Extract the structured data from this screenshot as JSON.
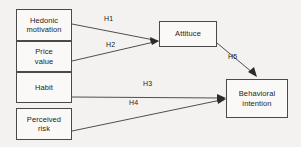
{
  "diagram": {
    "type": "path-diagram",
    "background_color": "#f3f2f0",
    "box_fill_color": "#faf9f7",
    "box_border_color": "#4a4a48",
    "line_color": "#3c3c3a",
    "nodes": [
      {
        "id": "hedonic",
        "line1": "Hedonic",
        "line2": "motivation"
      },
      {
        "id": "price",
        "line1": "Price",
        "line2": "value"
      },
      {
        "id": "habit",
        "line1": "Habit",
        "line2": ""
      },
      {
        "id": "risk",
        "line1": "Perceived",
        "line2": "risk"
      },
      {
        "id": "attitude",
        "line1": "Attituce",
        "line2": ""
      },
      {
        "id": "intention",
        "line1": "Behavioral",
        "line2": "intention"
      }
    ],
    "edges": [
      {
        "id": "h1",
        "label": "H1",
        "from": "hedonic",
        "to": "attitude"
      },
      {
        "id": "h2",
        "label": "H2",
        "from": "price",
        "to": "attitude"
      },
      {
        "id": "h3",
        "label": "H3",
        "from": "habit",
        "to": "intention"
      },
      {
        "id": "h4",
        "label": "H4",
        "from": "risk",
        "to": "intention"
      },
      {
        "id": "h5",
        "label": "H5",
        "from": "attitude",
        "to": "intention"
      }
    ]
  }
}
